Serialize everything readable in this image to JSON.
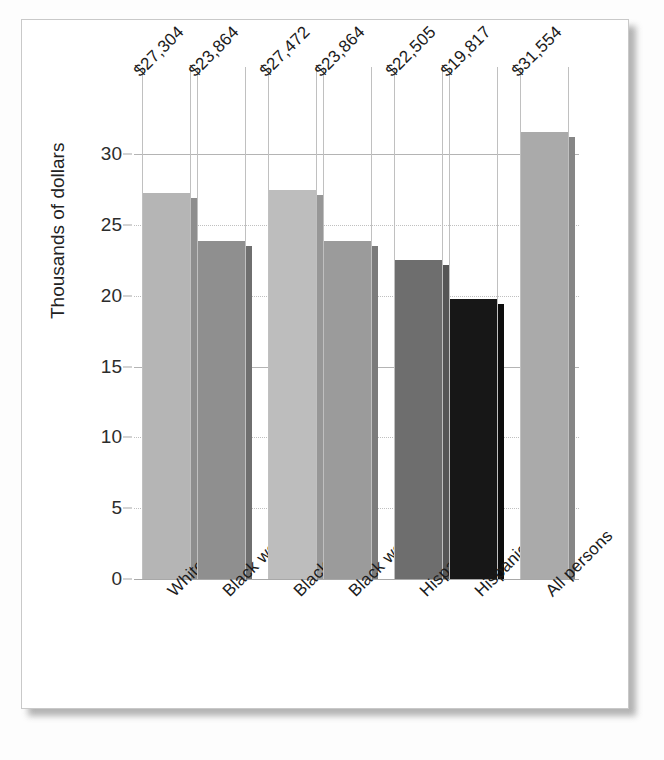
{
  "chart_data": {
    "type": "bar",
    "title": "",
    "subtitle": "",
    "xlabel": "",
    "ylabel": "Thousands of dollars",
    "categories": [
      "White women",
      "Black women",
      "Black men",
      "Black women",
      "Hispanic men",
      "Hispanic women",
      "All persons"
    ],
    "values": [
      27.304,
      23.864,
      27.472,
      23.864,
      22.505,
      19.817,
      31.554
    ],
    "data_labels": [
      "$27,304",
      "$23,864",
      "$27,472",
      "$23,864",
      "$22,505",
      "$19,817",
      "$31,554"
    ],
    "bar_colors": [
      "#b5b5b5",
      "#8f8f8f",
      "#bdbdbd",
      "#9b9b9b",
      "#6e6e6e",
      "#171717",
      "#aaaaaa"
    ],
    "bar_side_colors": [
      "#8e8e8e",
      "#6f6f6f",
      "#979797",
      "#7b7b7b",
      "#565656",
      "#0d0d0d",
      "#868686"
    ],
    "ylim": [
      0,
      32.5
    ],
    "yticks": [
      0,
      5,
      10,
      15,
      20,
      25,
      30
    ],
    "ytick_labels": [
      "0",
      "5",
      "10",
      "15",
      "20",
      "25",
      "30"
    ],
    "grid": "horizontal-and-vertical",
    "legend": "none",
    "units": "thousands of dollars"
  },
  "colors": {
    "gridline": "#c0c0c0",
    "axis": "#a8a8a8",
    "text": "#1b1b1b",
    "paper": "#ffffff",
    "frame": "#c9c9c9"
  }
}
